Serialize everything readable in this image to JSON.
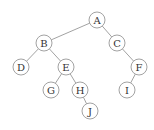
{
  "diagram": {
    "type": "binary-tree",
    "node_radius": 8,
    "colors": {
      "stroke": "#8a8a8a",
      "fill": "#ffffff",
      "text": "#333333",
      "background": "#ffffff"
    },
    "nodes": [
      {
        "id": "A",
        "label": "A",
        "x": 97,
        "y": 20
      },
      {
        "id": "B",
        "label": "B",
        "x": 44,
        "y": 43
      },
      {
        "id": "C",
        "label": "C",
        "x": 117,
        "y": 43
      },
      {
        "id": "D",
        "label": "D",
        "x": 21,
        "y": 67
      },
      {
        "id": "E",
        "label": "E",
        "x": 66,
        "y": 67
      },
      {
        "id": "F",
        "label": "F",
        "x": 139,
        "y": 67
      },
      {
        "id": "G",
        "label": "G",
        "x": 51,
        "y": 90
      },
      {
        "id": "H",
        "label": "H",
        "x": 80,
        "y": 90
      },
      {
        "id": "I",
        "label": "I",
        "x": 127,
        "y": 90
      },
      {
        "id": "J",
        "label": "J",
        "x": 90,
        "y": 111
      }
    ],
    "edges": [
      {
        "from": "A",
        "to": "B"
      },
      {
        "from": "A",
        "to": "C"
      },
      {
        "from": "B",
        "to": "D"
      },
      {
        "from": "B",
        "to": "E"
      },
      {
        "from": "C",
        "to": "F"
      },
      {
        "from": "E",
        "to": "G"
      },
      {
        "from": "E",
        "to": "H"
      },
      {
        "from": "F",
        "to": "I"
      },
      {
        "from": "H",
        "to": "J"
      }
    ]
  }
}
